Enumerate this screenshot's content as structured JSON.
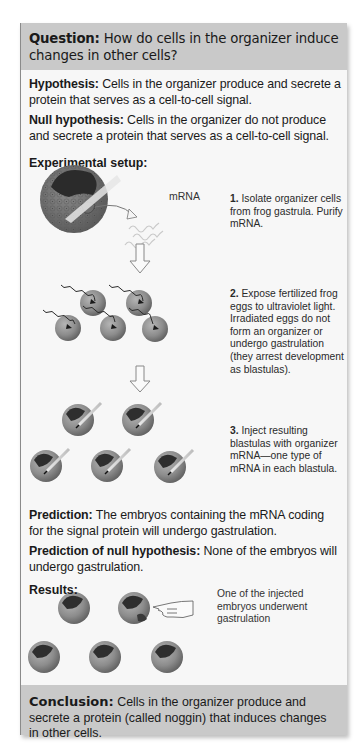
{
  "figure": {
    "header": {
      "label": "Question:",
      "text": " How do cells in the organizer induce changes in other cells?"
    },
    "hypothesis": {
      "label": "Hypothesis:",
      "text": " Cells in the organizer produce and secrete a protein that serves as a cell-to-cell signal."
    },
    "null_hypothesis": {
      "label": "Null hypothesis:",
      "text": " Cells in the organizer do not produce and secrete a protein that serves as a cell-to-cell signal."
    },
    "experimental_setup": {
      "label": "Experimental setup:",
      "mrna_label": "mRNA",
      "steps": [
        {
          "number": "1.",
          "text": " Isolate organizer cells from frog gastrula. Purify mRNA."
        },
        {
          "number": "2.",
          "text": " Expose fertilized frog eggs to ultraviolet light. Irradiated eggs do not form an organizer or undergo gastrulation (they arrest development as blastulas)."
        },
        {
          "number": "3.",
          "text": " Inject resulting blastulas with organizer mRNA—one type of mRNA in each blastula."
        }
      ]
    },
    "prediction": {
      "label": "Prediction:",
      "text": " The embryos containing the mRNA coding for the signal protein will undergo gastrulation."
    },
    "prediction_null": {
      "label": "Prediction of null hypothesis:",
      "text": " None of the embryos will undergo gastrulation."
    },
    "results": {
      "label": "Results:",
      "note": "One of the injected embryos underwent gastrulation"
    },
    "conclusion": {
      "label": "Conclusion:",
      "text": " Cells in the organizer produce and secrete a protein (called noggin) that induces changes in other cells."
    }
  },
  "colors": {
    "header_bg": "#c9c9c9",
    "body_bg": "#f7f7f7",
    "footer_bg": "#c9c9c9",
    "embryo_fill": "#8f8f8f",
    "embryo_dark": "#3a3a3a",
    "text": "#1a1a1a"
  }
}
